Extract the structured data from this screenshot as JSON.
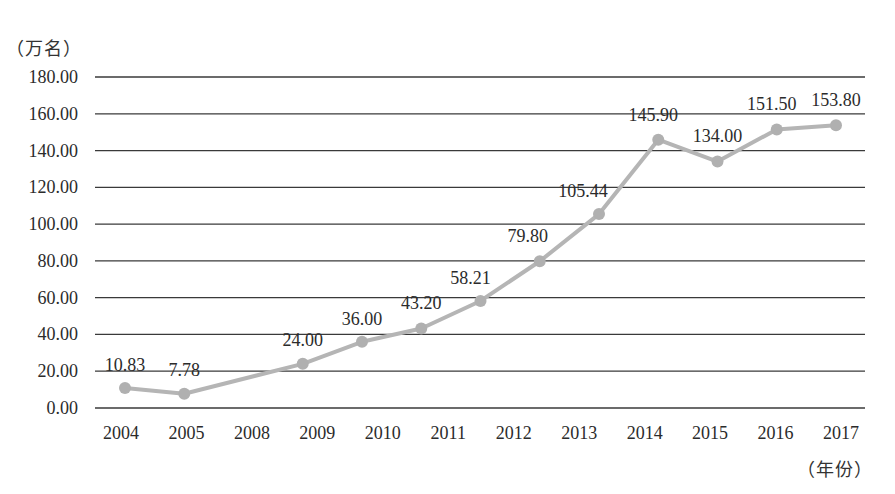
{
  "chart_data": {
    "type": "line",
    "title": "",
    "ylabel": "（万名）",
    "xlabel": "（年份）",
    "categories": [
      "2004",
      "2005",
      "2008",
      "2009",
      "2010",
      "2011",
      "2012",
      "2013",
      "2014",
      "2015",
      "2016",
      "2017"
    ],
    "series": [
      {
        "name": "",
        "values": [
          10.83,
          7.78,
          24.0,
          36.0,
          43.2,
          58.21,
          79.8,
          105.44,
          145.9,
          134.0,
          151.5,
          153.8
        ],
        "labels": [
          "10.83",
          "7.78",
          "24.00",
          "36.00",
          "43.20",
          "58.21",
          "79.80",
          "105.44",
          "145.90",
          "134.00",
          "151.50",
          "153.80"
        ],
        "marker_slots": [
          0,
          1,
          3,
          4,
          5,
          6,
          7,
          8,
          9,
          10,
          11,
          12
        ],
        "color": "#b5b5b5"
      }
    ],
    "yticks": [
      "0.00",
      "20.00",
      "40.00",
      "60.00",
      "80.00",
      "100.00",
      "120.00",
      "140.00",
      "160.00",
      "180.00"
    ],
    "ylim": [
      0,
      180
    ],
    "grid": true,
    "legend": null,
    "colors": {
      "grid": "#3a3a3a",
      "line": "#b5b5b5",
      "marker": "#b0b0b0",
      "text": "#2b2b2b"
    }
  },
  "axis": {
    "y_unit": "（万名）",
    "x_unit": "（年份）"
  }
}
